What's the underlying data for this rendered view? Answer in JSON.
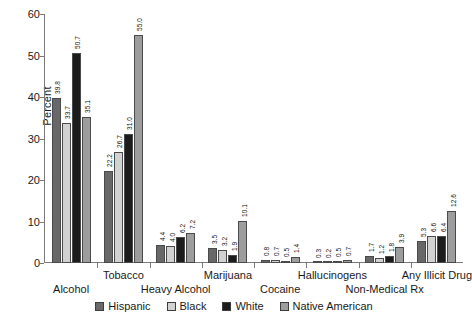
{
  "chart_data": {
    "type": "bar",
    "title": "",
    "xlabel": "",
    "ylabel": "Percent",
    "ylim": [
      0,
      60
    ],
    "yticks": [
      0,
      10,
      20,
      30,
      40,
      50,
      60
    ],
    "grid": false,
    "legend_position": "bottom",
    "categories": [
      "Alcohol",
      "Tobacco",
      "Heavy Alcohol",
      "Marijuana",
      "Cocaine",
      "Hallucinogens",
      "Non-Medical Rx",
      "Any Illicit Drug"
    ],
    "series": [
      {
        "name": "Hispanic",
        "color": "#686868",
        "values": [
          39.8,
          22.2,
          4.4,
          3.5,
          0.8,
          0.3,
          1.7,
          5.3
        ]
      },
      {
        "name": "Black",
        "color": "#d2d2d2",
        "values": [
          33.7,
          26.7,
          4.0,
          3.2,
          0.7,
          0.2,
          1.2,
          6.6
        ]
      },
      {
        "name": "White",
        "color": "#1c1c1c",
        "values": [
          50.7,
          31.0,
          6.2,
          1.9,
          0.5,
          0.5,
          1.8,
          6.4
        ]
      },
      {
        "name": "Native American",
        "color": "#9d9d9d",
        "values": [
          35.1,
          55.0,
          7.2,
          10.1,
          1.4,
          0.7,
          3.9,
          12.6
        ]
      }
    ]
  },
  "axis": {
    "y_title": "Percent",
    "y_tick_labels": [
      "0",
      "10",
      "20",
      "30",
      "40",
      "50",
      "60"
    ]
  },
  "x_labels": [
    {
      "text": "Alcohol",
      "row": "bot"
    },
    {
      "text": "Tobacco",
      "row": "top"
    },
    {
      "text": "Heavy Alcohol",
      "row": "bot"
    },
    {
      "text": "Marijuana",
      "row": "top"
    },
    {
      "text": "Cocaine",
      "row": "bot"
    },
    {
      "text": "Hallucinogens",
      "row": "top"
    },
    {
      "text": "Non-Medical Rx",
      "row": "bot"
    },
    {
      "text": "Any Illicit Drug",
      "row": "top"
    }
  ],
  "legend": {
    "items": [
      {
        "label": "Hispanic",
        "color": "#686868"
      },
      {
        "label": "Black",
        "color": "#d2d2d2"
      },
      {
        "label": "White",
        "color": "#1c1c1c"
      },
      {
        "label": "Native American",
        "color": "#9d9d9d"
      }
    ]
  }
}
